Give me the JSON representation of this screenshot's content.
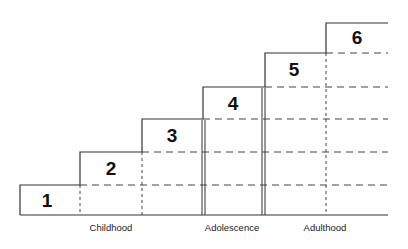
{
  "diagram": {
    "type": "staircase",
    "steps": [
      {
        "label": "1"
      },
      {
        "label": "2"
      },
      {
        "label": "3"
      },
      {
        "label": "4"
      },
      {
        "label": "5"
      },
      {
        "label": "6"
      }
    ],
    "stages": [
      {
        "label": "Childhood"
      },
      {
        "label": "Adolescence"
      },
      {
        "label": "Adulthood"
      }
    ],
    "colors": {
      "line": "#333333",
      "background": "#ffffff"
    }
  }
}
